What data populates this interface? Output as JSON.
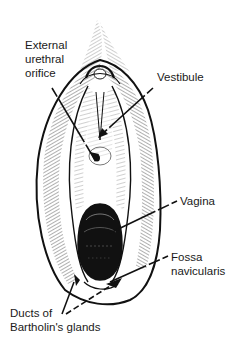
{
  "figure": {
    "style": "black ink hatched drawing on white",
    "colors": {
      "background": "#ffffff",
      "ink": "#111111",
      "label_text": "#1a1a1a"
    }
  },
  "labels": {
    "urethral": {
      "lines": [
        "External",
        "urethral",
        "orifice"
      ],
      "full": "External urethral orifice"
    },
    "vestibule": {
      "lines": [
        "Vestibule"
      ],
      "full": "Vestibule"
    },
    "vagina": {
      "lines": [
        "Vagina"
      ],
      "full": "Vagina"
    },
    "fossa": {
      "lines": [
        "Fossa",
        "navicularis"
      ],
      "full": "Fossa navicularis"
    },
    "ducts": {
      "lines": [
        "Ducts of",
        "Bartholin's glands"
      ],
      "full": "Ducts of Bartholin's glands"
    }
  }
}
